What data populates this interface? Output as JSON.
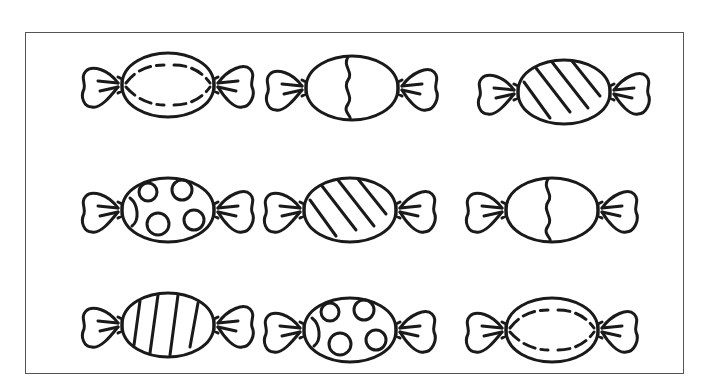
{
  "worksheet": {
    "stroke_color": "#1a1a1a",
    "frame_color": "#555555",
    "background": "#ffffff",
    "candies": [
      {
        "row": 1,
        "col": 1,
        "pattern": "dashed-lens",
        "x": 78,
        "y": 45
      },
      {
        "row": 1,
        "col": 2,
        "pattern": "wavy-split",
        "x": 262,
        "y": 48
      },
      {
        "row": 1,
        "col": 3,
        "pattern": "diagonal-stripes",
        "x": 474,
        "y": 52
      },
      {
        "row": 2,
        "col": 1,
        "pattern": "polka-dots",
        "x": 78,
        "y": 170
      },
      {
        "row": 2,
        "col": 2,
        "pattern": "diagonal-stripes",
        "x": 260,
        "y": 170
      },
      {
        "row": 2,
        "col": 3,
        "pattern": "wavy-split",
        "x": 462,
        "y": 170
      },
      {
        "row": 3,
        "col": 1,
        "pattern": "vertical-stripes",
        "x": 78,
        "y": 285
      },
      {
        "row": 3,
        "col": 2,
        "pattern": "polka-dots",
        "x": 260,
        "y": 290
      },
      {
        "row": 3,
        "col": 3,
        "pattern": "dashed-lens",
        "x": 462,
        "y": 290
      }
    ]
  }
}
